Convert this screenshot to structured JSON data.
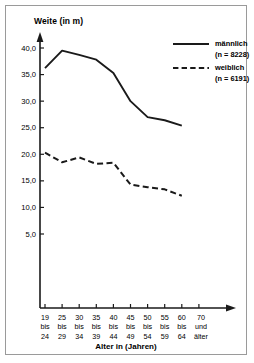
{
  "chart_data": {
    "type": "line",
    "title": "",
    "ylabel": "Weite (in m)",
    "xlabel": "Alter in (Jahren)",
    "ylim": [
      0,
      42.5
    ],
    "yticks": [
      5.0,
      10.0,
      15.0,
      20.0,
      25.0,
      30.0,
      35.0,
      40.0
    ],
    "ytick_labels": [
      "5,0",
      "10,0",
      "15,0",
      "20,0",
      "25,0",
      "30,0",
      "35,0",
      "40,0"
    ],
    "grid": false,
    "legend_position": "top-right",
    "categories": [
      {
        "line1": "19",
        "line2": "bis",
        "line3": "24"
      },
      {
        "line1": "25",
        "line2": "bis",
        "line3": "29"
      },
      {
        "line1": "30",
        "line2": "bis",
        "line3": "34"
      },
      {
        "line1": "35",
        "line2": "bis",
        "line3": "39"
      },
      {
        "line1": "40",
        "line2": "bis",
        "line3": "44"
      },
      {
        "line1": "45",
        "line2": "bis",
        "line3": "49"
      },
      {
        "line1": "50",
        "line2": "bis",
        "line3": "54"
      },
      {
        "line1": "55",
        "line2": "bis",
        "line3": "59"
      },
      {
        "line1": "60",
        "line2": "bis",
        "line3": "64"
      }
    ],
    "last_category": {
      "line1": "70",
      "line2": "und",
      "line3": "älter"
    },
    "series": [
      {
        "name": "männlich",
        "count_label": "(n = 8228)",
        "style": "solid",
        "color": "#1a1a1a",
        "values": [
          36.2,
          39.5,
          38.7,
          37.8,
          35.3,
          30.0,
          27.0,
          26.4,
          25.4
        ]
      },
      {
        "name": "weiblich",
        "count_label": "(n = 6191)",
        "style": "dashed",
        "color": "#1a1a1a",
        "values": [
          20.3,
          18.5,
          19.4,
          18.2,
          18.4,
          14.3,
          13.8,
          13.4,
          12.2
        ]
      }
    ]
  }
}
